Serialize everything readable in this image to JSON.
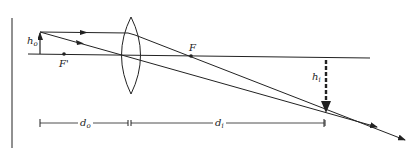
{
  "diagram": {
    "labels": {
      "object_height": "h",
      "object_height_sub": "o",
      "image_height": "h",
      "image_height_sub": "i",
      "focal_point_right": "F",
      "focal_point_left": "F'",
      "object_distance": "d",
      "object_distance_sub": "o",
      "image_distance": "d",
      "image_distance_sub": "i"
    },
    "colors": {
      "line": "#222222",
      "background": "#ffffff"
    }
  }
}
